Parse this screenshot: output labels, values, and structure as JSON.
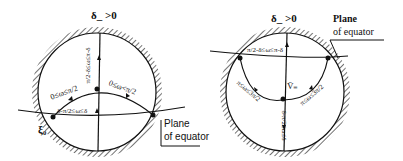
{
  "figure_left": {
    "top_label": "δ_ >0",
    "vertical_label": "π/2-δ≤ω≤π-δ",
    "arc_left_label": "0≤ω≤π/2",
    "arc_right_label": "0≤ω<π/2",
    "bottom_label": "δ-π/2≤ω≤δ",
    "xi_label": "ξ₀",
    "plane_label_line1": "Plane",
    "plane_label_line2": "of equator"
  },
  "figure_right": {
    "top_label": "δ_ >0",
    "top_arc_label": "π/2-δ≤ω≤π-δ",
    "left_arc_label": "π≤ω≤3π/2",
    "right_arc_label": "π≤ω≤3π/2",
    "center_label": "V̄₌",
    "bottom_label": "δ-π/2≤ω≤δ",
    "plane_label_line1": "Plane",
    "plane_label_line2": "of equator"
  },
  "colors": {
    "ink": "#111111",
    "background": "#ffffff"
  }
}
